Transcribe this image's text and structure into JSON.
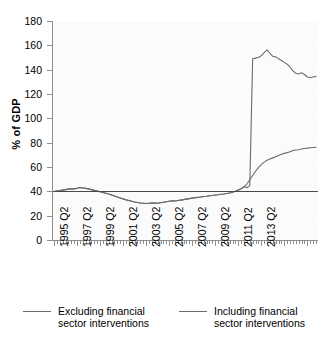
{
  "chart_data": {
    "type": "line",
    "title": "",
    "xlabel": "",
    "ylabel": "% of GDP",
    "ylim": [
      0,
      180
    ],
    "ytick_step": 20,
    "yticks": [
      "0",
      "20",
      "40",
      "60",
      "80",
      "100",
      "120",
      "140",
      "160",
      "180"
    ],
    "xticks": [
      "1995 Q2",
      "1997 Q2",
      "1999 Q2",
      "2001 Q2",
      "2003 Q2",
      "2005 Q2",
      "2007 Q2",
      "2009 Q2",
      "2011 Q2",
      "2013 Q2"
    ],
    "grid": true,
    "grid_color": "#ffffff",
    "legend_position": "bottom",
    "reference_line": {
      "value": 40,
      "color": "#4a4a4a"
    },
    "line_color": "#6b6b6b",
    "x_start_label": "1995 Q2",
    "x_end_label": "2013 Q2",
    "x_frequency": "quarterly",
    "series": [
      {
        "name": "Excluding financial sector interventions",
        "values": [
          39.8,
          40.2,
          40.6,
          41.0,
          41.4,
          41.8,
          42.2,
          42.0,
          42.6,
          43.2,
          42.8,
          42.4,
          42.0,
          41.4,
          40.8,
          40.2,
          39.6,
          39.0,
          38.4,
          37.8,
          37.0,
          36.2,
          35.4,
          34.6,
          33.8,
          33.0,
          32.4,
          31.8,
          31.2,
          30.8,
          30.4,
          30.2,
          30.0,
          30.2,
          30.4,
          30.3,
          30.2,
          30.6,
          31.0,
          31.4,
          31.8,
          32.2,
          32.0,
          32.4,
          32.8,
          33.2,
          33.6,
          34.0,
          34.4,
          34.8,
          35.0,
          35.4,
          35.8,
          36.0,
          36.4,
          36.6,
          37.0,
          37.2,
          37.6,
          37.8,
          38.2,
          38.6,
          39.2,
          40.0,
          41.2,
          42.0,
          43.6,
          46.0,
          49.5,
          53.0,
          56.5,
          59.5,
          62.0,
          64.0,
          65.5,
          66.5,
          67.5,
          68.5,
          69.5,
          70.5,
          71.2,
          71.8,
          72.5,
          73.5,
          74.0,
          74.2,
          74.8,
          75.2,
          75.5,
          75.8,
          76.0,
          76.2
        ]
      },
      {
        "name": "Including financial sector interventions",
        "values": [
          39.8,
          40.2,
          40.6,
          41.0,
          41.4,
          41.8,
          42.2,
          42.0,
          42.6,
          43.2,
          42.8,
          42.4,
          42.0,
          41.4,
          40.8,
          40.2,
          39.6,
          39.0,
          38.4,
          37.8,
          37.0,
          36.2,
          35.4,
          34.6,
          33.8,
          33.0,
          32.4,
          31.8,
          31.2,
          30.8,
          30.4,
          30.2,
          30.0,
          30.2,
          30.4,
          30.3,
          30.2,
          30.6,
          31.0,
          31.4,
          31.8,
          32.2,
          32.0,
          32.4,
          32.8,
          33.2,
          33.6,
          34.0,
          34.4,
          34.8,
          35.0,
          35.4,
          35.8,
          36.0,
          36.4,
          36.6,
          37.0,
          37.2,
          37.6,
          37.8,
          38.2,
          38.6,
          39.2,
          40.0,
          41.2,
          42.0,
          44.0,
          43.0,
          44.5,
          149.0,
          149.5,
          150.0,
          151.5,
          154.0,
          156.2,
          153.5,
          151.0,
          150.5,
          149.0,
          147.5,
          146.0,
          144.5,
          142.0,
          139.0,
          137.0,
          136.5,
          137.5,
          136.0,
          134.0,
          133.5,
          134.0,
          134.5
        ]
      }
    ]
  },
  "legend": {
    "items": [
      {
        "label": "Excluding financial\nsector interventions"
      },
      {
        "label": "Including financial\nsector interventions"
      }
    ]
  }
}
